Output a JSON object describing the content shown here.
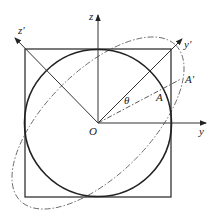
{
  "diagram": {
    "type": "geometry",
    "labels": {
      "z": "z",
      "y": "y",
      "z_prime": "z'",
      "y_prime": "y'",
      "origin": "O",
      "point_a": "A",
      "point_a_prime": "A'",
      "angle": "θ"
    },
    "colors": {
      "stroke": "#333333",
      "dashed": "#555555",
      "background": "#ffffff"
    }
  }
}
